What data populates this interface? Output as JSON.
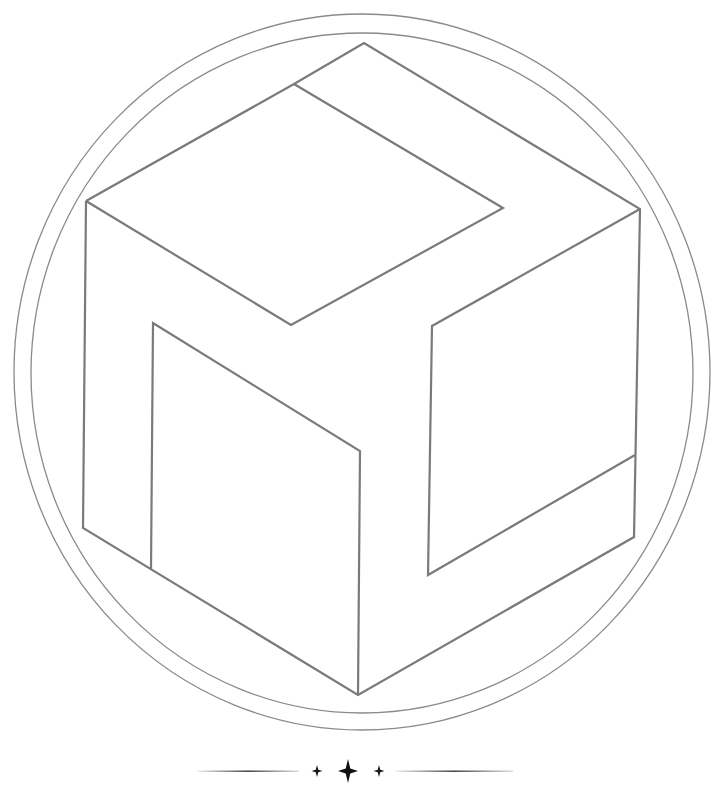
{
  "artwork": {
    "subject": "isometric cube line-art emblem inside a double circle",
    "line_color": "#7a7a7a",
    "background": "#ffffff"
  },
  "divider": {
    "ornament": "sparkle-stars",
    "color": "#1a1a1a"
  }
}
